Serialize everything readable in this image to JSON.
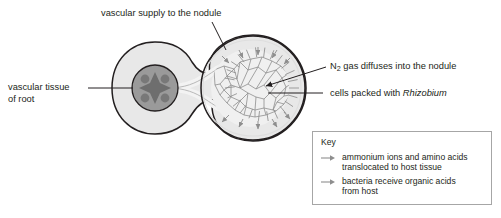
{
  "diagram": {
    "title_labels": {
      "vascular_supply": "vascular supply to the nodule",
      "vascular_tissue_line1": "vascular tissue",
      "vascular_tissue_line2": "of root",
      "n2_label_pre": "N",
      "n2_label_sub": "2",
      "n2_label_post": " gas diffuses into the nodule",
      "rhizobium_pre": "cells packed with ",
      "rhizobium_italic": "Rhizobium"
    },
    "key": {
      "title": "Key",
      "entries": [
        {
          "line1": "ammonium ions and amino acids",
          "line2": "translocated to host tissue",
          "arrow": "right-arrow-icon"
        },
        {
          "line1": "bacteria receive organic acids",
          "line2": "from host",
          "arrow": "right-arrow-icon"
        }
      ]
    },
    "colors": {
      "outline": "#231f20",
      "tissue_fill": "#e8e8e8",
      "vascular_core_fill": "#9a9a9a",
      "vascular_core_dots": "#6e6e6e",
      "cell_mesh": "#8e8e8e",
      "arrow_gray": "#8e8e8e",
      "key_border": "#a6a6a6",
      "background": "#ffffff"
    },
    "parts": {
      "root_cross_section": "root-cross-section",
      "nodule": "nodule",
      "vascular_channel": "vascular-channel",
      "cell_mass": "rhizobium-cell-mass"
    }
  }
}
